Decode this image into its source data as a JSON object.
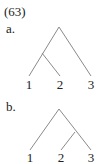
{
  "example_number": "(63)",
  "trees": [
    {
      "label": "a.",
      "structure": "[[1 2] 3]",
      "leaves": [
        "1",
        "2",
        "3"
      ]
    },
    {
      "label": "b.",
      "structure": "[1 [2 3]]",
      "leaves": [
        "1",
        "2",
        "3"
      ]
    }
  ],
  "colors": {
    "line": "#8a8a8a",
    "text": "#222222"
  }
}
